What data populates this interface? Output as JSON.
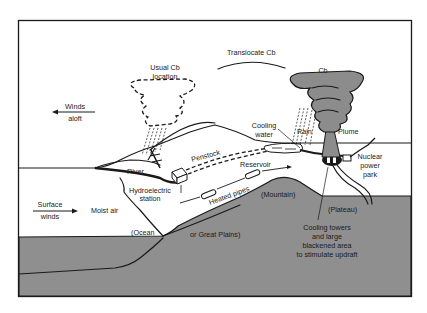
{
  "figure": {
    "colors": {
      "ground": "#8f8f8f",
      "cloud_fill": "#8c8c8c",
      "ink": "#1a1a1a",
      "background": "#ffffff"
    }
  },
  "labels": {
    "usual_cb_line1": "Usual Cb",
    "usual_cb_line2": "location",
    "translocate_cb": "Translocate Cb",
    "cb": "Cb",
    "winds_aloft_line1": "Winds",
    "winds_aloft_line2": "aloft",
    "rain": "Rain",
    "plume": "Plume",
    "cooling_water_line1": "Cooling",
    "cooling_water_line2": "water",
    "penstock": "Penstock",
    "reservoir": "Reservoir",
    "river": "River",
    "hydroelectric_line1": "Hydroelectric",
    "hydroelectric_line2": "station",
    "nuclear_line1": "Nuclear",
    "nuclear_line2": "power",
    "nuclear_line3": "park",
    "surface_winds_line1": "Surface",
    "surface_winds_line2": "winds",
    "moist_air": "Moist air",
    "heated_pipes": "Heated pipes",
    "mountain": "(Mountain)",
    "plateau": "(Plateau)",
    "ocean": "(Ocean",
    "great_plains": "or Great Plains)",
    "cooling_towers_line1": "Cooling towers",
    "cooling_towers_line2": "and large",
    "cooling_towers_line3": "blackened area",
    "cooling_towers_line4": "to stimulate updraft"
  }
}
